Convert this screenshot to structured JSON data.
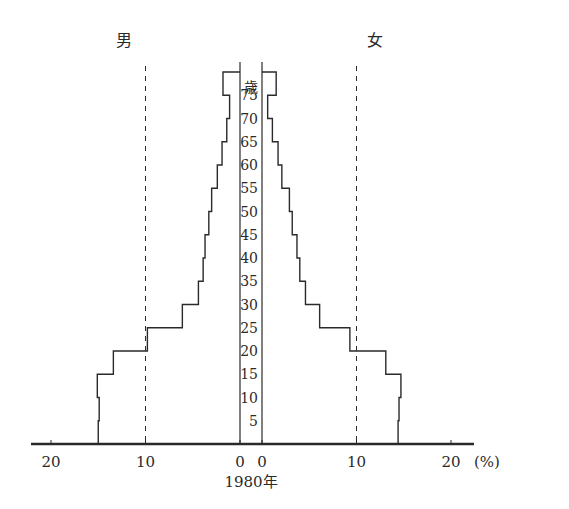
{
  "chart_data": {
    "type": "bar",
    "subtype": "population-pyramid",
    "title": "1980年",
    "left_label": "男",
    "right_label": "女",
    "center_axis_label": "歳",
    "xlabel": "(%)",
    "x_ticks_left": [
      "20",
      "10",
      "0"
    ],
    "x_ticks_right": [
      "0",
      "10",
      "20"
    ],
    "x_unit": "(%)",
    "xlim": [
      0,
      20
    ],
    "gridlines": {
      "dashed_at": [
        10
      ]
    },
    "age_tick_labels": [
      "5",
      "10",
      "15",
      "20",
      "25",
      "30",
      "35",
      "40",
      "45",
      "50",
      "55",
      "60",
      "65",
      "70",
      "75"
    ],
    "categories": [
      "0-4",
      "5-9",
      "10-14",
      "15-19",
      "20-24",
      "25-29",
      "30-34",
      "35-39",
      "40-44",
      "45-49",
      "50-54",
      "55-59",
      "60-64",
      "65-69",
      "70-74",
      "75+"
    ],
    "series": [
      {
        "name": "男",
        "values": [
          15.0,
          14.9,
          15.1,
          13.4,
          9.8,
          6.1,
          4.4,
          3.9,
          3.7,
          3.3,
          3.0,
          2.4,
          1.9,
          1.4,
          1.1,
          1.8
        ]
      },
      {
        "name": "女",
        "values": [
          14.4,
          14.5,
          14.7,
          13.1,
          9.3,
          6.1,
          4.6,
          4.0,
          3.7,
          3.2,
          2.9,
          2.1,
          1.7,
          1.1,
          0.6,
          1.5
        ]
      }
    ],
    "legend": "none"
  }
}
